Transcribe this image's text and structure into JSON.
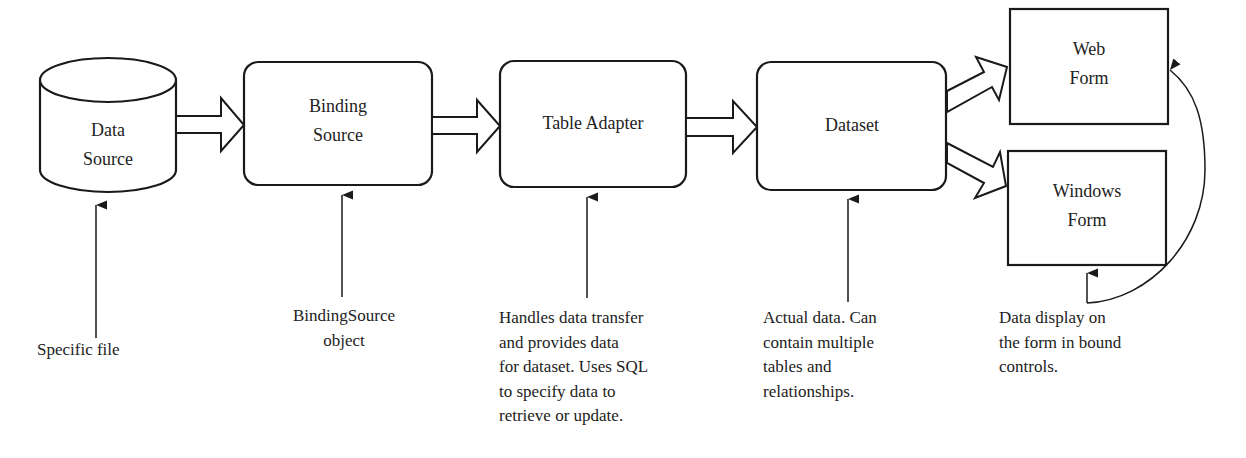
{
  "diagram": {
    "type": "flowchart",
    "nodes": [
      {
        "id": "data_source",
        "label": "Data\nSource",
        "shape": "cylinder"
      },
      {
        "id": "binding_source",
        "label": "Binding\nSource",
        "shape": "rounded-rect"
      },
      {
        "id": "table_adapter",
        "label": "Table Adapter",
        "shape": "rounded-rect"
      },
      {
        "id": "dataset",
        "label": "Dataset",
        "shape": "rounded-rect"
      },
      {
        "id": "web_form",
        "label": "Web\nForm",
        "shape": "rect"
      },
      {
        "id": "windows_form",
        "label": "Windows\nForm",
        "shape": "rect"
      }
    ],
    "edges": [
      {
        "from": "data_source",
        "to": "binding_source",
        "style": "block-arrow"
      },
      {
        "from": "binding_source",
        "to": "table_adapter",
        "style": "block-arrow"
      },
      {
        "from": "table_adapter",
        "to": "dataset",
        "style": "block-arrow"
      },
      {
        "from": "dataset",
        "to": "web_form",
        "style": "block-arrow"
      },
      {
        "from": "dataset",
        "to": "windows_form",
        "style": "block-arrow"
      }
    ],
    "annotations": [
      {
        "target": "data_source",
        "text": "Specific file"
      },
      {
        "target": "binding_source",
        "text": "BindingSource\nobject"
      },
      {
        "target": "table_adapter",
        "text": "Handles data transfer\nand provides data\nfor dataset. Uses SQL\nto specify data to\nretrieve or update."
      },
      {
        "target": "dataset",
        "text": "Actual data. Can\ncontain multiple\ntables and\nrelationships."
      },
      {
        "target": "web_form, windows_form",
        "text": "Data display on\nthe form in bound\ncontrols."
      }
    ]
  },
  "colors": {
    "stroke": "#1a1a1a",
    "background": "#ffffff",
    "text": "#222222"
  }
}
